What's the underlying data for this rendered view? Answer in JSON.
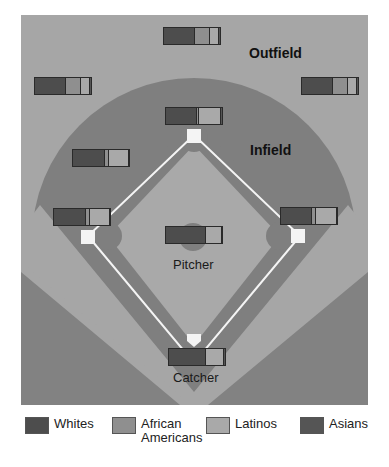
{
  "colors": {
    "frame_bg": "#a6a6a6",
    "infield_grass": "#7f7f7f",
    "dirt_light": "#a9a9a9",
    "foul_dark": "#828282",
    "base": "#f4f4f4",
    "line": "#f4f4f4"
  },
  "labels": {
    "outfield": "Outfield",
    "infield": "Infield",
    "pitcher": "Pitcher",
    "catcher": "Catcher"
  },
  "legend": [
    {
      "label": "Whites",
      "color": "#4d4d4d"
    },
    {
      "label": "African\nAmericans",
      "label_line1": "African",
      "label_line2": "Americans",
      "color": "#8f8f8f"
    },
    {
      "label": "Latinos",
      "color": "#a9a9a9"
    },
    {
      "label": "Asians",
      "color": "#555555"
    }
  ],
  "chart_data": {
    "type": "bar",
    "subtype": "stacked-horizontal-100%",
    "title": "",
    "series_names": [
      "Whites",
      "African Americans",
      "Latinos",
      "Asians"
    ],
    "positions": [
      {
        "name": "Center field",
        "x": 163,
        "y": 27,
        "values": [
          53,
          28,
          15,
          4
        ]
      },
      {
        "name": "Left field",
        "x": 34,
        "y": 77,
        "values": [
          53,
          28,
          15,
          4
        ]
      },
      {
        "name": "Right field",
        "x": 301,
        "y": 77,
        "values": [
          53,
          28,
          15,
          4
        ]
      },
      {
        "name": "Second base",
        "x": 165,
        "y": 107,
        "values": [
          53,
          5,
          38,
          4
        ]
      },
      {
        "name": "Shortstop",
        "x": 72,
        "y": 149,
        "values": [
          55,
          8,
          35,
          2
        ]
      },
      {
        "name": "Third base",
        "x": 53,
        "y": 208,
        "values": [
          55,
          8,
          35,
          2
        ]
      },
      {
        "name": "First base",
        "x": 280,
        "y": 207,
        "values": [
          53,
          8,
          37,
          2
        ]
      },
      {
        "name": "Pitcher",
        "x": 165,
        "y": 226,
        "values": [
          69,
          0,
          29,
          2
        ]
      },
      {
        "name": "Catcher",
        "x": 168,
        "y": 348,
        "values": [
          65,
          0,
          32,
          3
        ]
      }
    ],
    "bar_width": 58,
    "legend_position": "bottom"
  }
}
